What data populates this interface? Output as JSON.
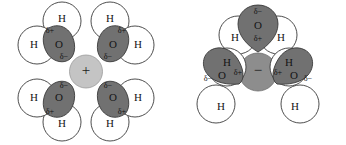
{
  "figure": {
    "background_color": "#ffffff",
    "colors": {
      "oxygen_lobe": "#717171",
      "hydrogen_shell": "#ffffff",
      "outline": "#3a3a3a",
      "cation_fill": "#c4c4c4",
      "anion_fill": "#8d8d8d",
      "text": "#111111"
    },
    "labels": {
      "oxygen": "O",
      "hydrogen": "H",
      "delta_negative": "δ−",
      "delta_positive": "δ+",
      "cation_charge": "+",
      "anion_charge": "−"
    },
    "panels": [
      {
        "id": "cation-hydration",
        "name": "cation-hydration-diagram",
        "ion": {
          "species": "cation",
          "charge_symbol": "+",
          "fill": "#c4c4c4"
        },
        "water_count": 4,
        "orientation_note": "oxygen lobes point toward the central cation",
        "molecules": [
          {
            "id": "left-water-top-left",
            "position": "top-left",
            "oxygen_label": "O",
            "hydrogen_labels": [
              "H",
              "H"
            ],
            "delta_on_oxygen": "δ−",
            "delta_on_hydrogen_side": "δ+"
          },
          {
            "id": "left-water-top-right",
            "position": "top-right",
            "oxygen_label": "O",
            "hydrogen_labels": [
              "H",
              "H"
            ],
            "delta_on_oxygen": "δ−",
            "delta_on_hydrogen_side": "δ+"
          },
          {
            "id": "left-water-bottom-left",
            "position": "bottom-left",
            "oxygen_label": "O",
            "hydrogen_labels": [
              "H",
              "H"
            ],
            "delta_on_oxygen": "δ−",
            "delta_on_hydrogen_side": "δ+"
          },
          {
            "id": "left-water-bottom-right",
            "position": "bottom-right",
            "oxygen_label": "O",
            "hydrogen_labels": [
              "H",
              "H"
            ],
            "delta_on_oxygen": "δ−",
            "delta_on_hydrogen_side": "δ+"
          }
        ]
      },
      {
        "id": "anion-hydration",
        "name": "anion-hydration-diagram",
        "ion": {
          "species": "anion",
          "charge_symbol": "−",
          "fill": "#8d8d8d"
        },
        "water_count": 3,
        "orientation_note": "hydrogen atoms point toward the central anion",
        "molecules": [
          {
            "id": "right-water-top",
            "position": "top",
            "oxygen_label": "O",
            "hydrogen_labels": [
              "H",
              "H"
            ],
            "delta_on_oxygen": "δ−",
            "delta_on_hydrogen_side": "δ+"
          },
          {
            "id": "right-water-bottom-left",
            "position": "bottom-left",
            "oxygen_label": "O",
            "hydrogen_labels": [
              "H",
              "H"
            ],
            "delta_on_oxygen": "δ−",
            "delta_on_hydrogen_side": "δ+"
          },
          {
            "id": "right-water-bottom-right",
            "position": "bottom-right",
            "oxygen_label": "O",
            "hydrogen_labels": [
              "H",
              "H"
            ],
            "delta_on_oxygen": "δ−",
            "delta_on_hydrogen_side": "δ+"
          }
        ]
      }
    ]
  }
}
